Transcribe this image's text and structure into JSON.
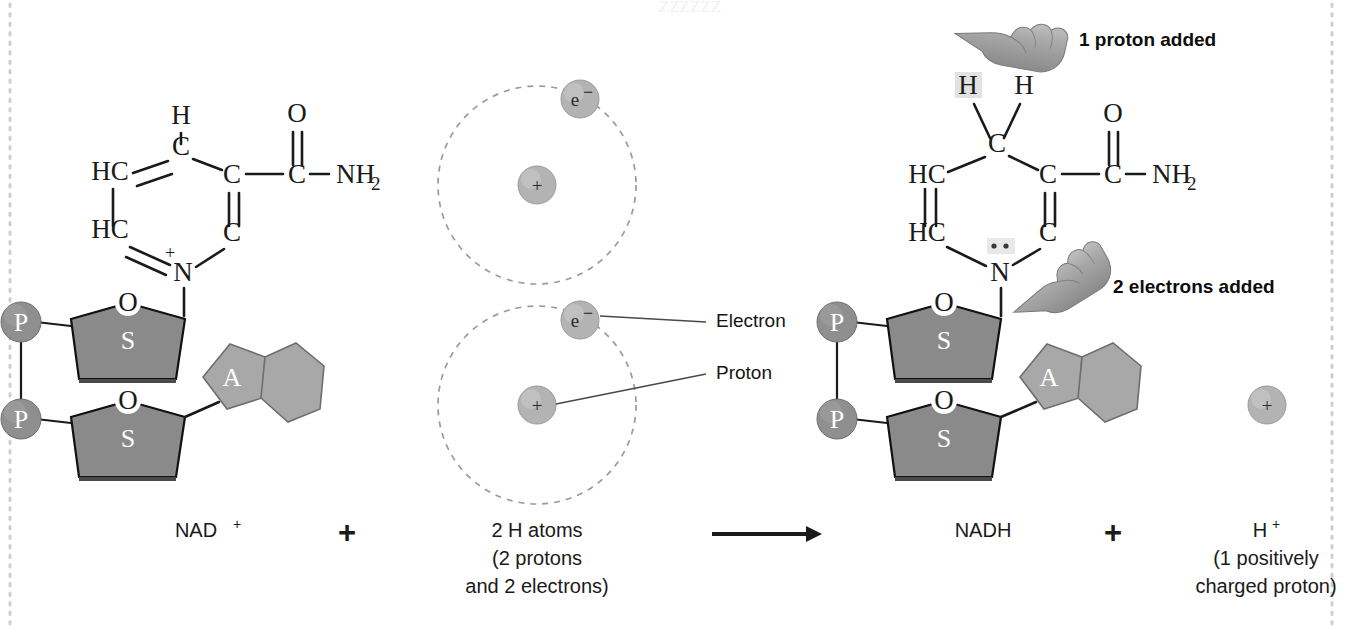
{
  "figure": {
    "title_semantic": "nad-plus-reduction-to-nadh",
    "watermark": "ZZZZZZ"
  },
  "colors": {
    "sugar_fill": "#8a8a8a",
    "sugar_edge": "#4a4a4a",
    "adenine_fill": "#a8a8a8",
    "phosphate_fill": "#8f8f8f",
    "particle_fill": "#b3b3b3",
    "orbit_stroke": "#9b9b9b",
    "bond_stroke": "#1a1a1a",
    "page_border": "#cfcfcf",
    "highlight": "#e2e2e2"
  },
  "nad_plus": {
    "name": "NAD+",
    "ring_atoms": [
      {
        "id": "c-top",
        "label": "C",
        "x": 181,
        "y": 155
      },
      {
        "id": "hc-upper-left",
        "label": "HC",
        "x": 110,
        "y": 180
      },
      {
        "id": "hc-lower-left",
        "label": "HC",
        "x": 110,
        "y": 238
      },
      {
        "id": "n-bottom",
        "label": "N",
        "x": 183,
        "y": 277
      },
      {
        "id": "c-lower-right",
        "label": "C",
        "x": 232,
        "y": 238
      },
      {
        "id": "c-upper-right",
        "label": "C",
        "x": 232,
        "y": 180
      }
    ],
    "substituents": [
      {
        "id": "h-top",
        "label": "H",
        "x": 181,
        "y": 124
      },
      {
        "id": "c-amide",
        "label": "C",
        "x": 297,
        "y": 180
      },
      {
        "id": "o-carbonyl",
        "label": "O",
        "x": 297,
        "y": 120
      },
      {
        "id": "nh2",
        "label": "NH",
        "sub": "2",
        "x": 336,
        "y": 180
      }
    ],
    "charge_symbol": "+",
    "phosphates": [
      {
        "label": "P",
        "x": 21,
        "y": 322
      },
      {
        "label": "P",
        "x": 21,
        "y": 419
      }
    ],
    "sugars": [
      {
        "label": "S",
        "oxygen_label": "O",
        "x": 128,
        "y": 330
      },
      {
        "label": "S",
        "oxygen_label": "O",
        "x": 128,
        "y": 428
      }
    ],
    "adenine": {
      "label": "A",
      "x": 213,
      "y": 378
    }
  },
  "hydrogen_atoms": {
    "caption_label": "2 H atoms",
    "atoms": [
      {
        "id": "h-atom-top",
        "cx": 537,
        "cy": 185,
        "r": 99,
        "electron": {
          "label": "e",
          "charge": "−",
          "cx": 580,
          "cy": 99
        },
        "proton": {
          "label": "+",
          "cx": 537,
          "cy": 185
        }
      },
      {
        "id": "h-atom-bottom",
        "cx": 537,
        "cy": 405,
        "r": 99,
        "electron": {
          "label": "e",
          "charge": "−",
          "cx": 580,
          "cy": 320
        },
        "proton": {
          "label": "+",
          "cx": 537,
          "cy": 405
        }
      }
    ],
    "callouts": [
      {
        "id": "electron-callout",
        "label": "Electron",
        "x": 716,
        "y": 327
      },
      {
        "id": "proton-callout",
        "label": "Proton",
        "x": 716,
        "y": 379
      }
    ]
  },
  "nadh": {
    "name": "NADH",
    "ring_atoms": [
      {
        "id": "c-top",
        "label": "C",
        "x": 997,
        "y": 149
      },
      {
        "id": "hc-upper-left",
        "label": "HC",
        "x": 927,
        "y": 180
      },
      {
        "id": "hc-lower-left",
        "label": "HC",
        "x": 927,
        "y": 238
      },
      {
        "id": "n-bottom",
        "label": "N",
        "x": 1000,
        "y": 277
      },
      {
        "id": "c-lower-right",
        "label": "C",
        "x": 1048,
        "y": 238
      },
      {
        "id": "c-upper-right",
        "label": "C",
        "x": 1048,
        "y": 180
      }
    ],
    "substituents": [
      {
        "id": "h-added",
        "label": "H",
        "x": 968,
        "y": 92,
        "highlighted": true
      },
      {
        "id": "h-second",
        "label": "H",
        "x": 1024,
        "y": 92,
        "highlighted": false
      },
      {
        "id": "c-amide",
        "label": "C",
        "x": 1113,
        "y": 180
      },
      {
        "id": "o-carbonyl",
        "label": "O",
        "x": 1113,
        "y": 120
      },
      {
        "id": "nh2",
        "label": "NH",
        "sub": "2",
        "x": 1152,
        "y": 180
      }
    ],
    "lone_pair_dots": 2,
    "phosphates": [
      {
        "label": "P",
        "x": 837,
        "y": 322
      },
      {
        "label": "P",
        "x": 837,
        "y": 419
      }
    ],
    "sugars": [
      {
        "label": "S",
        "oxygen_label": "O",
        "x": 944,
        "y": 330
      },
      {
        "label": "S",
        "oxygen_label": "O",
        "x": 944,
        "y": 428
      }
    ],
    "adenine": {
      "label": "A",
      "x": 1030,
      "y": 378
    }
  },
  "annotations": [
    {
      "id": "proton-added",
      "label": "1 proton added",
      "x": 1079,
      "y": 46,
      "icon": "pointing-hand-icon"
    },
    {
      "id": "electrons-added",
      "label": "2 electrons added",
      "x": 1113,
      "y": 293,
      "icon": "pointing-hand-icon"
    }
  ],
  "free_proton": {
    "label": "+",
    "cx": 1267,
    "cy": 405,
    "r": 19
  },
  "equation": {
    "terms": [
      {
        "id": "term-nad",
        "label": "NAD",
        "sup": "+",
        "sublines": [],
        "x": 196,
        "y": 537
      },
      {
        "id": "operator-plus1",
        "label": "+",
        "sup": "",
        "sublines": [],
        "x": 347,
        "y": 540
      },
      {
        "id": "term-h-atoms",
        "label": "2 H atoms",
        "sup": "",
        "sublines": [
          "(2 protons",
          "and 2 electrons)"
        ],
        "x": 537,
        "y": 537
      },
      {
        "id": "term-nadh",
        "label": "NADH",
        "sup": "",
        "sublines": [],
        "x": 983,
        "y": 537
      },
      {
        "id": "operator-plus2",
        "label": "+",
        "sup": "",
        "sublines": [],
        "x": 1113,
        "y": 540
      },
      {
        "id": "term-h-plus",
        "label": "H",
        "sup": "+",
        "sublines": [
          "(1 positively",
          "charged proton)"
        ],
        "x": 1266,
        "y": 537
      }
    ],
    "arrow": {
      "id": "reaction-arrow",
      "x1": 712,
      "x2": 818,
      "y": 534
    }
  }
}
